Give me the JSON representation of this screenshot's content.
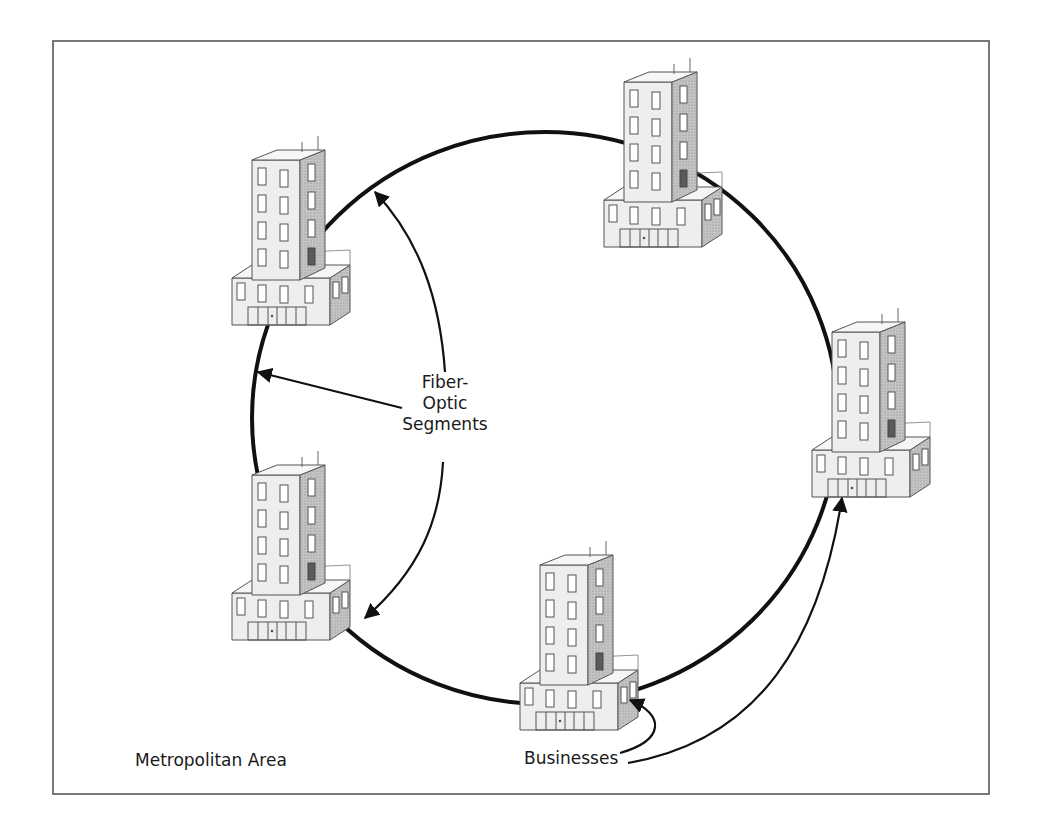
{
  "diagram": {
    "type": "metropolitan-fiber-ring",
    "labels": {
      "segments": [
        "Fiber-",
        "Optic",
        "Segments"
      ],
      "businesses": "Businesses",
      "area": "Metropolitan Area"
    },
    "ring": {
      "cx": 545,
      "cy": 418,
      "rx": 293,
      "ry": 286,
      "stroke": "#111111",
      "stroke_width": 4
    },
    "buildings": [
      {
        "id": "building-top-left",
        "x": 200,
        "y": 130
      },
      {
        "id": "building-top-right",
        "x": 570,
        "y": 50
      },
      {
        "id": "building-right",
        "x": 780,
        "y": 300
      },
      {
        "id": "building-bottom-left",
        "x": 200,
        "y": 440
      },
      {
        "id": "building-bottom",
        "x": 490,
        "y": 530
      }
    ],
    "colors": {
      "building_front": "#ececec",
      "building_side": "#bdbdbd",
      "building_outline": "#555555",
      "door": "#666666",
      "frame": "#777777"
    }
  }
}
